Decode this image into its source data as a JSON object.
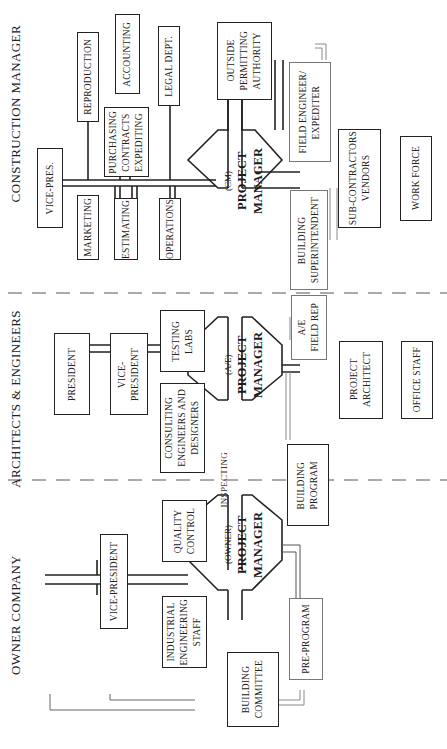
{
  "sections": {
    "owner": "OWNER COMPANY",
    "architects": "ARCHITECTS & ENGINEERS",
    "construction": "CONSTRUCTION MANAGER"
  },
  "project_managers": {
    "owner": {
      "qualifier": "(OWNER)",
      "title": "PROJECT\nMANAGER"
    },
    "ae": {
      "qualifier": "(A/E)",
      "title": "PROJECT\nMANAGER"
    },
    "cm": {
      "qualifier": "(CM)",
      "title": "PROJECT\nMANAGER"
    }
  },
  "owner_boxes": {
    "vice_president": "VICE-PRESIDENT",
    "quality_control": "QUALITY\nCONTROL",
    "industrial_engineering": "INDUSTRIAL\nENGINEERING\nSTAFF",
    "building_committee": "BUILDING\nCOMMITTEE",
    "pre_program": "PRE-PROGRAM",
    "building_program": "BUILDING\nPROGRAM"
  },
  "ae_boxes": {
    "president": "PRESIDENT",
    "vice_president": "VICE-\nPRESIDENT",
    "testing_labs": "TESTING\nLABS",
    "consulting": "CONSULTING\nENGINEERS AND\nDESIGNERS",
    "field_rep": "A/E\nFIELD  REP",
    "project_architect": "PROJECT\nARCHITECT",
    "office_staff": "OFFICE STAFF"
  },
  "cm_boxes": {
    "vice_pres": "VICE-PRES.",
    "reproduction": "REPRODUCTION",
    "marketing": "MARKETING",
    "accounting": "ACCOUNTING",
    "purchasing": "PURCHASING\nCONTRACTS\nEXPEDITING",
    "estimating": "ESTIMATING",
    "legal": "LEGAL DEPT.",
    "operations": "OPERATIONS",
    "outside_permitting": "OUTSIDE\nPERMITTING\nAUTHORITY",
    "field_engineer": "FIELD ENGINEER/\nEXPEDITER",
    "building_superintendent": "BUILDING\nSUPERINTENDENT",
    "subcontractors": "SUB-CONTRACTORS\nVENDORS",
    "work_force": "WORK FORCE"
  },
  "annotations": {
    "inspecting": "INSPECTING"
  }
}
